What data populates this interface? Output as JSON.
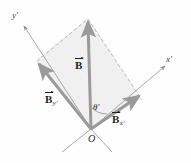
{
  "figure": {
    "colors": {
      "vector_gray": "#9a9a9a",
      "parallelogram_fill": "#f0f0f0",
      "axis_line": "#8a8a8a",
      "dashed_line": "#b5b5b5",
      "label_text": "#1f1f1f",
      "background": "#ffffff"
    },
    "axes": [
      {
        "name": "y-prime-axis",
        "label_base": "y",
        "label_prime": "′",
        "x": 14,
        "y": 16
      },
      {
        "name": "x-prime-axis",
        "label_base": "x",
        "label_prime": "′",
        "x": 168,
        "y": 58
      }
    ],
    "origin": {
      "label": "O",
      "x": 88,
      "y": 136
    },
    "angle": {
      "label_base": "θ",
      "label_prime": "′",
      "x": 94,
      "y": 104
    },
    "vectors": [
      {
        "name": "resultant",
        "base": "B",
        "subscript": "",
        "x": 75,
        "y": 58
      },
      {
        "name": "y-component",
        "base": "B",
        "subscript": "y′",
        "x": 45,
        "y": 92
      },
      {
        "name": "x-component",
        "base": "B",
        "subscript": "x′",
        "x": 113,
        "y": 112
      }
    ],
    "geometry": {
      "origin_point": [
        91,
        129
      ],
      "b_tip": [
        88,
        18
      ],
      "by_tip": [
        36,
        60
      ],
      "bx_tip": [
        142,
        99
      ],
      "xaxis_start": [
        84,
        133
      ],
      "xaxis_end": [
        166,
        66
      ],
      "yaxis_start": [
        98,
        133
      ],
      "yaxis_end": [
        22,
        24
      ],
      "xaxis_neg_end": [
        62,
        151
      ],
      "yaxis_neg_end": [
        108,
        151
      ]
    }
  }
}
